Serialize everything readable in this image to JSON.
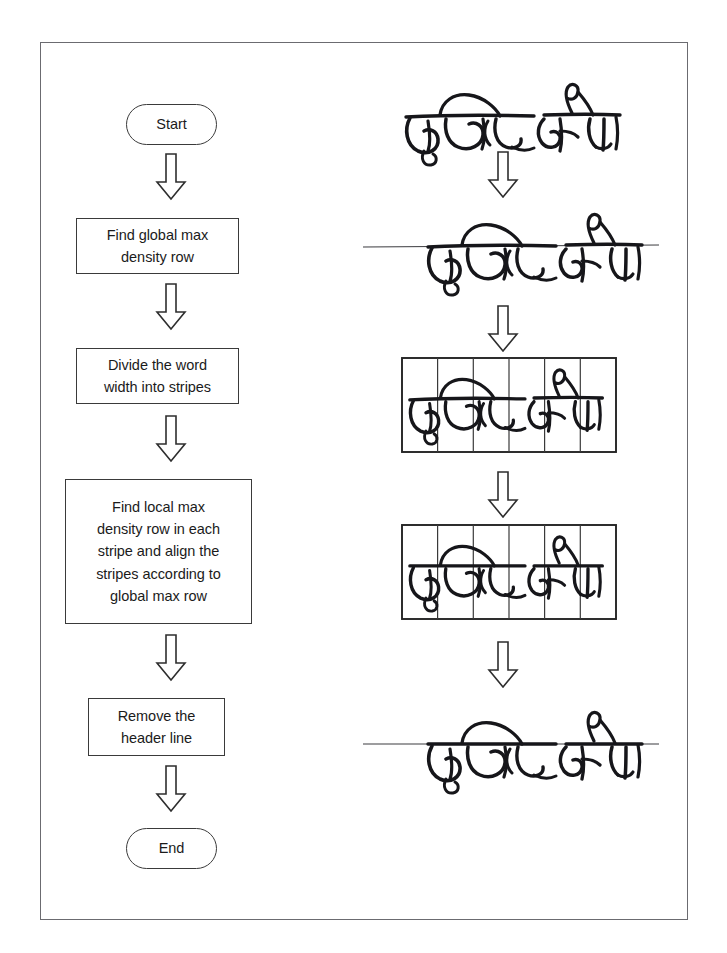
{
  "figure": {
    "kind": "flowchart-with-image-stages",
    "frame": {
      "border_color": "#6b6b70",
      "background": "#ffffff"
    },
    "ink_color": "#16161a",
    "shape_border_color": "#3a3a3a",
    "arrow_fill": "#ffffff",
    "arrow_stroke": "#2e2e2e"
  },
  "flowchart": {
    "title": "",
    "nodes": [
      {
        "id": "start",
        "type": "terminator",
        "label": "Start"
      },
      {
        "id": "step1",
        "type": "process",
        "label": "Find global max\ndensity row"
      },
      {
        "id": "step2",
        "type": "process",
        "label": "Divide the word\nwidth into stripes"
      },
      {
        "id": "step3",
        "type": "process",
        "label": "Find local max\ndensity row in each\nstripe and align the\nstripes according to\nglobal max row"
      },
      {
        "id": "step4",
        "type": "process",
        "label": "Remove the\nheader line"
      },
      {
        "id": "end",
        "type": "terminator",
        "label": "End"
      }
    ],
    "connectors": [
      {
        "from": "start",
        "to": "step1",
        "glyph": "down-block-arrow"
      },
      {
        "from": "step1",
        "to": "step2",
        "glyph": "down-block-arrow"
      },
      {
        "from": "step2",
        "to": "step3",
        "glyph": "down-block-arrow"
      },
      {
        "from": "step3",
        "to": "step4",
        "glyph": "down-block-arrow"
      },
      {
        "from": "step4",
        "to": "end",
        "glyph": "down-block-arrow"
      }
    ]
  },
  "image_stages": {
    "word_text": "दृष्टिकोण",
    "word_transliteration": "drishtikon",
    "stripe_count": 6,
    "stages": [
      {
        "id": "stage1",
        "caption": "original handwritten word",
        "has_header_line": false,
        "has_stripe_grid": false,
        "aligned": false
      },
      {
        "id": "stage2",
        "caption": "global max density row marked",
        "has_header_line": true,
        "has_stripe_grid": false,
        "aligned": false
      },
      {
        "id": "stage3",
        "caption": "word width divided into stripes",
        "has_header_line": false,
        "has_stripe_grid": true,
        "aligned": false
      },
      {
        "id": "stage4",
        "caption": "stripes aligned to global max row",
        "has_header_line": false,
        "has_stripe_grid": true,
        "aligned": true
      },
      {
        "id": "stage5",
        "caption": "header line removed result",
        "has_header_line": true,
        "has_stripe_grid": false,
        "aligned": true
      }
    ],
    "connectors": [
      {
        "from": "stage1",
        "to": "stage2",
        "glyph": "down-block-arrow"
      },
      {
        "from": "stage2",
        "to": "stage3",
        "glyph": "down-block-arrow"
      },
      {
        "from": "stage3",
        "to": "stage4",
        "glyph": "down-block-arrow"
      },
      {
        "from": "stage4",
        "to": "stage5",
        "glyph": "down-block-arrow"
      }
    ]
  }
}
